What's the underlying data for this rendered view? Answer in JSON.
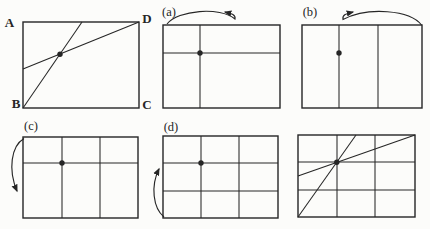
{
  "figure": {
    "background_color": "#fcfcfa",
    "ink_color": "#262626",
    "main_panel": {
      "corner_top_left": "A",
      "corner_top_right": "D",
      "corner_bottom_left": "B",
      "corner_bottom_right": "C"
    },
    "step_panels": {
      "a_label": "(a)",
      "b_label": "(b)",
      "c_label": "(c)",
      "d_label": "(d)"
    }
  }
}
